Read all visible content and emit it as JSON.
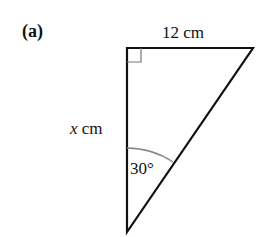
{
  "part_label": "(a)",
  "labels": {
    "top_side": "12 cm",
    "left_side_var": "x",
    "left_side_unit": " cm",
    "angle": "30°"
  },
  "figure": {
    "shape": "right triangle",
    "vertices": {
      "top_left": [
        127,
        48
      ],
      "top_right": [
        253,
        48
      ],
      "bottom": [
        127,
        232
      ]
    },
    "right_angle_at": "top_left",
    "angle_marked_at": "bottom",
    "stroke_color": "#111111",
    "arc_color": "#888888"
  }
}
